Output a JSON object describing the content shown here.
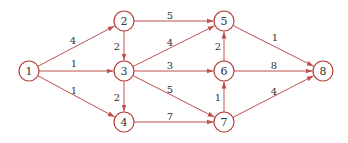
{
  "diagram": {
    "type": "directed-weighted-network",
    "edge_color": "#c0504d",
    "node_stroke": "#b5403a",
    "nodes": [
      {
        "id": "1",
        "label": "1",
        "x": 29,
        "y": 71
      },
      {
        "id": "2",
        "label": "2",
        "x": 124,
        "y": 21
      },
      {
        "id": "3",
        "label": "3",
        "x": 124,
        "y": 71
      },
      {
        "id": "4",
        "label": "4",
        "x": 124,
        "y": 122
      },
      {
        "id": "5",
        "label": "5",
        "x": 224,
        "y": 21
      },
      {
        "id": "6",
        "label": "6",
        "x": 224,
        "y": 71
      },
      {
        "id": "7",
        "label": "7",
        "x": 224,
        "y": 122
      },
      {
        "id": "8",
        "label": "8",
        "x": 323,
        "y": 71
      }
    ],
    "edges": [
      {
        "from": "1",
        "to": "2",
        "weight": "4",
        "lx": 73,
        "ly": 40
      },
      {
        "from": "1",
        "to": "3",
        "weight": "1",
        "lx": 74,
        "ly": 63
      },
      {
        "from": "1",
        "to": "4",
        "weight": "1",
        "lx": 74,
        "ly": 90
      },
      {
        "from": "2",
        "to": "3",
        "weight": "2",
        "lx": 117,
        "ly": 46
      },
      {
        "from": "2",
        "to": "5",
        "weight": "5",
        "lx": 170,
        "ly": 15
      },
      {
        "from": "3",
        "to": "4",
        "weight": "2",
        "lx": 117,
        "ly": 97
      },
      {
        "from": "3",
        "to": "5",
        "weight": "4",
        "lx": 170,
        "ly": 42
      },
      {
        "from": "3",
        "to": "6",
        "weight": "3",
        "lx": 170,
        "ly": 65
      },
      {
        "from": "3",
        "to": "7",
        "weight": "5",
        "lx": 170,
        "ly": 89
      },
      {
        "from": "4",
        "to": "7",
        "weight": "7",
        "lx": 170,
        "ly": 116
      },
      {
        "from": "6",
        "to": "5",
        "weight": "2",
        "lx": 218,
        "ly": 46
      },
      {
        "from": "7",
        "to": "6",
        "weight": "1",
        "lx": 218,
        "ly": 97
      },
      {
        "from": "5",
        "to": "8",
        "weight": "1",
        "lx": 275,
        "ly": 37
      },
      {
        "from": "6",
        "to": "8",
        "weight": "8",
        "lx": 274,
        "ly": 65
      },
      {
        "from": "7",
        "to": "8",
        "weight": "4",
        "lx": 274,
        "ly": 91
      }
    ]
  }
}
